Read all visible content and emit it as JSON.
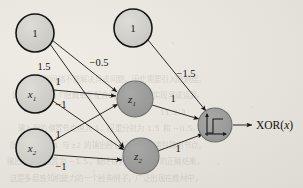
{
  "figure": {
    "background_color": "#e6e3dc",
    "ink_color": "#1d1d1d",
    "node_fill_light": "#cfcdc8",
    "node_fill_dark": "#9d9d9c"
  },
  "nodes": [
    {
      "id": "bias1",
      "label": "1",
      "sub": "",
      "cx": 35,
      "cy": 33,
      "r": 19,
      "shade": "light",
      "kind": "bias-node"
    },
    {
      "id": "bias2",
      "label": "1",
      "sub": "",
      "cx": 133,
      "cy": 28,
      "r": 19,
      "shade": "light",
      "kind": "bias-node"
    },
    {
      "id": "x1",
      "label": "x",
      "sub": "1",
      "cx": 35,
      "cy": 94,
      "r": 19,
      "shade": "light",
      "kind": "input-node"
    },
    {
      "id": "x2",
      "label": "x",
      "sub": "2",
      "cx": 35,
      "cy": 148,
      "r": 19,
      "shade": "light",
      "kind": "input-node"
    },
    {
      "id": "z1",
      "label": "z",
      "sub": "1",
      "cx": 135,
      "cy": 99,
      "r": 18,
      "shade": "dark",
      "kind": "hidden-node"
    },
    {
      "id": "z2",
      "label": "z",
      "sub": "2",
      "cx": 141,
      "cy": 156,
      "r": 18,
      "shade": "dark",
      "kind": "hidden-node"
    },
    {
      "id": "output",
      "label": "",
      "sub": "",
      "cx": 215,
      "cy": 125,
      "r": 17,
      "shade": "dark",
      "kind": "output-node"
    }
  ],
  "edges": [
    {
      "from": "bias1",
      "to": "z2",
      "weight": "1.5",
      "lx": 44,
      "ly": 66
    },
    {
      "from": "bias1",
      "to": "z1",
      "weight": "−0.5",
      "lx": 99,
      "ly": 62
    },
    {
      "from": "x1",
      "to": "z1",
      "weight": "1",
      "lx": 58,
      "ly": 81
    },
    {
      "from": "x1",
      "to": "z2",
      "weight": "−1",
      "lx": 61,
      "ly": 104
    },
    {
      "from": "x2",
      "to": "z1",
      "weight": "1",
      "lx": 58,
      "ly": 134
    },
    {
      "from": "x2",
      "to": "z2",
      "weight": "−1",
      "lx": 61,
      "ly": 166
    },
    {
      "from": "bias2",
      "to": "output",
      "weight": "−1.5",
      "lx": 184,
      "ly": 73
    },
    {
      "from": "z1",
      "to": "output",
      "weight": "1",
      "lx": 173,
      "ly": 98
    },
    {
      "from": "z2",
      "to": "output",
      "weight": "1",
      "lx": 178,
      "ly": 148
    }
  ],
  "output": {
    "label_main": "XOR(",
    "label_var": "x",
    "label_close": ")",
    "label_x": 254,
    "label_y": 129,
    "activation_icon": "step-function-icon"
  },
  "background_text": "                                                                        \n                                                                        \n                                                                        \n      一个单层网络不能解决异或问题，因此需要引入隐藏层。\n   如图所示，两个隐藏单元配合阈值函数即可实现异或运算。\n                                                        11.2.3\n     输入层的偏置节点恒为 1，权重分别为 1.5 和 −0.5。\n  隐藏层单元 z1 与 z2 的输出经过权重 1 传递到输出节点，\n 输出节点的偏置为 −1.5，最终得到 XOR(x) 的正确结果。\n  这是多层感知机能力的一个经典例子，广泛出现在教材中。"
}
